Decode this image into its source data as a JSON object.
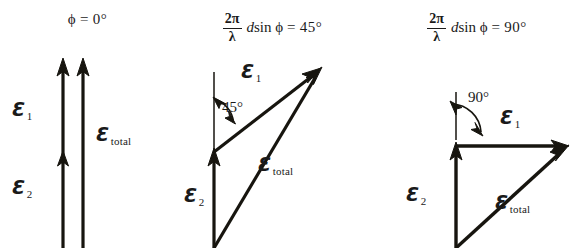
{
  "figure": {
    "background": "#ffffff",
    "ink_color": "#17150f",
    "width": 584,
    "height": 248
  },
  "panels": [
    {
      "id": "phase-0",
      "header": {
        "kind": "simple",
        "phi_symbol": "ϕ",
        "equals": "=",
        "value": "0°",
        "text": "ϕ = 0°"
      },
      "angle_between_vectors_deg": 0,
      "labels": {
        "e1": {
          "symbol": "Ɛ",
          "subscript": "1"
        },
        "e2": {
          "symbol": "Ɛ",
          "subscript": "2"
        },
        "etotal": {
          "symbol": "Ɛ",
          "subscript": "total"
        }
      },
      "angle_marker": null,
      "vectors": [
        {
          "name": "e2",
          "from": [
            63,
            248
          ],
          "to": [
            63,
            155
          ]
        },
        {
          "name": "e1",
          "from": [
            63,
            155
          ],
          "to": [
            63,
            60
          ]
        },
        {
          "name": "etotal",
          "from": [
            83,
            248
          ],
          "to": [
            83,
            60
          ]
        }
      ]
    },
    {
      "id": "phase-45",
      "header": {
        "kind": "formula",
        "numerator": "2π",
        "denominator": "λ",
        "d": "d",
        "func": "sin",
        "phi_symbol": "ϕ",
        "equals": "=",
        "value": "45°",
        "text": "2π/λ d sin ϕ = 45°"
      },
      "angle_between_vectors_deg": 45,
      "labels": {
        "e1": {
          "symbol": "Ɛ",
          "subscript": "1"
        },
        "e2": {
          "symbol": "Ɛ",
          "subscript": "2"
        },
        "etotal": {
          "symbol": "Ɛ",
          "subscript": "total"
        }
      },
      "angle_marker": {
        "text": "45°",
        "reference": "vertical"
      },
      "vectors": [
        {
          "name": "e2",
          "from": [
            214,
            248
          ],
          "to": [
            214,
            152
          ]
        },
        {
          "name": "e1",
          "from": [
            214,
            152
          ],
          "to": [
            320,
            70
          ]
        },
        {
          "name": "etotal",
          "from": [
            214,
            248
          ],
          "to": [
            320,
            70
          ]
        }
      ]
    },
    {
      "id": "phase-90",
      "header": {
        "kind": "formula",
        "numerator": "2π",
        "denominator": "λ",
        "d": "d",
        "func": "sin",
        "phi_symbol": "ϕ",
        "equals": "=",
        "value": "90°",
        "text": "2π/λ d sin ϕ = 90°"
      },
      "angle_between_vectors_deg": 90,
      "labels": {
        "e1": {
          "symbol": "Ɛ",
          "subscript": "1"
        },
        "e2": {
          "symbol": "Ɛ",
          "subscript": "2"
        },
        "etotal": {
          "symbol": "Ɛ",
          "subscript": "total"
        }
      },
      "angle_marker": {
        "text": "90°",
        "reference": "vertical"
      },
      "vectors": [
        {
          "name": "e2",
          "from": [
            456,
            248
          ],
          "to": [
            456,
            146
          ]
        },
        {
          "name": "e1",
          "from": [
            456,
            146
          ],
          "to": [
            568,
            146
          ]
        },
        {
          "name": "etotal",
          "from": [
            456,
            248
          ],
          "to": [
            568,
            146
          ]
        }
      ]
    }
  ]
}
